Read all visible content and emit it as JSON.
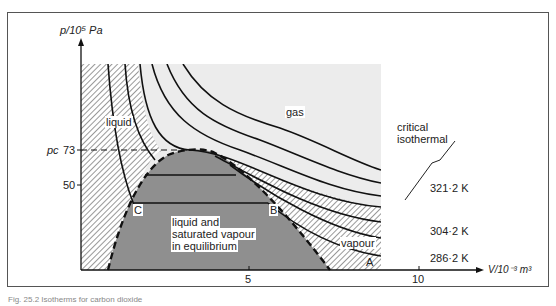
{
  "figure": {
    "y_axis_label": "p/10⁵ Pa",
    "x_axis_label": "V/10⁻³ m³",
    "y_ticks": [
      {
        "label": "73",
        "prefix": "pᴄ"
      },
      {
        "label": "50"
      }
    ],
    "pc_label": "pᴄ",
    "x_ticks": [
      "5",
      "10"
    ],
    "regions": {
      "liquid": "liquid",
      "gas": "gas",
      "vapour": "vapour",
      "coexistence_1": "liquid and",
      "coexistence_2": "saturated vapour",
      "coexistence_3": "in equilibrium"
    },
    "annotation_1": "critical",
    "annotation_2": "isothermal",
    "points": {
      "A": "A",
      "B": "B",
      "C": "C"
    },
    "isotherm_labels": [
      "321·2 K",
      "304·2 K",
      "286·2 K"
    ],
    "caption": "Fig. 25.2  Isotherms for carbon dioxide"
  },
  "colors": {
    "liquid_hatch": "#555555",
    "gas_fill": "#ececec",
    "coexistence_fill": "#8f8f8f",
    "line": "#111111"
  }
}
